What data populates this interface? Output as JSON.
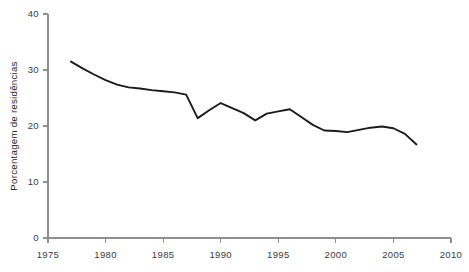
{
  "chart_data": {
    "type": "line",
    "title": "",
    "subtitle": "",
    "xlabel": "",
    "ylabel": "Porcentagem de residências",
    "xlim": [
      1975,
      2010
    ],
    "ylim": [
      0,
      40
    ],
    "xticks": [
      1975,
      1980,
      1985,
      1990,
      1995,
      2000,
      2005,
      2010
    ],
    "yticks": [
      0,
      10,
      20,
      30,
      40
    ],
    "xtick_labels": [
      "1975",
      "1980",
      "1985",
      "1990",
      "1995",
      "2000",
      "2005",
      "2010"
    ],
    "ytick_labels": [
      "0",
      "10",
      "20",
      "30",
      "40"
    ],
    "grid": false,
    "legend": null,
    "annotations": [],
    "series": [
      {
        "name": "Porcentagem de residências",
        "color": "#1b1b1b",
        "x": [
          1977,
          1978,
          1979,
          1980,
          1981,
          1982,
          1983,
          1984,
          1985,
          1986,
          1987,
          1988,
          1989,
          1990,
          1991,
          1992,
          1993,
          1994,
          1995,
          1996,
          1997,
          1998,
          1999,
          2000,
          2001,
          2002,
          2003,
          2004,
          2005,
          2006,
          2007
        ],
        "values": [
          31.5,
          30.3,
          29.2,
          28.2,
          27.4,
          26.9,
          26.7,
          26.4,
          26.2,
          26.0,
          25.6,
          21.4,
          22.8,
          24.1,
          23.2,
          22.3,
          21.0,
          22.2,
          22.6,
          23.0,
          21.6,
          20.2,
          19.2,
          19.1,
          18.9,
          19.3,
          19.7,
          19.9,
          19.6,
          18.6,
          16.7
        ]
      }
    ]
  },
  "axis": {
    "tick_color": "#8e8e8e",
    "line_color": "#8e8e8e",
    "label_color": "#3a3a3a"
  }
}
